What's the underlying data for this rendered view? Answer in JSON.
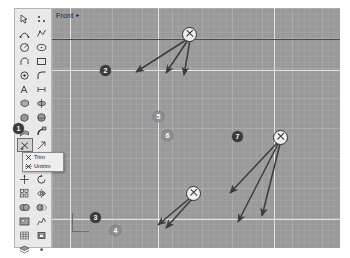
{
  "app": {
    "name": "cad-modeler",
    "viewport_label": "Front",
    "viewport_dropdown_glyph": "▸"
  },
  "viewport": {
    "background_color": "#9a9a9a",
    "grid_color": "#ffffff",
    "axis_color": "#e4e4e4",
    "dark_line_color": "#4a4a4a"
  },
  "markers": [
    {
      "label": "1",
      "style": "dark",
      "x": 18,
      "y": 128,
      "note": "points at selected trim tool in toolbar"
    },
    {
      "label": "2",
      "style": "dark",
      "x": 105,
      "y": 70,
      "note": "on horizontal axis line"
    },
    {
      "label": "3",
      "style": "dark",
      "x": 95,
      "y": 217,
      "note": "near origin gizmo"
    },
    {
      "label": "4",
      "style": "light",
      "x": 115,
      "y": 230,
      "note": "bottom edge"
    },
    {
      "label": "5",
      "style": "light",
      "x": 158,
      "y": 116,
      "note": "on vertical axis"
    },
    {
      "label": "6",
      "style": "light",
      "x": 167,
      "y": 135,
      "note": "below marker 5"
    },
    {
      "label": "7",
      "style": "dark",
      "x": 237,
      "y": 136,
      "note": "left of right X target"
    }
  ],
  "x_targets": [
    {
      "name": "x-target-top",
      "x": 188,
      "y": 33,
      "arrow_count": 3
    },
    {
      "name": "x-target-middle",
      "x": 192,
      "y": 192,
      "arrow_count": 2
    },
    {
      "name": "x-target-right",
      "x": 279,
      "y": 136,
      "arrow_count": 3
    }
  ],
  "toolbar": {
    "name": "modeling-toolbar",
    "selected_tool": "trim-tool",
    "icons": [
      "pointer-select-icon",
      "control-point-icon",
      "arc-icon",
      "polyline-icon",
      "circle-icon",
      "ellipse-icon",
      "curve-icon",
      "rectangle-icon",
      "point-icon",
      "fillet-icon",
      "text-object-icon",
      "dimension-icon",
      "extrude-solid-icon",
      "revolve-solid-icon",
      "box-solid-icon",
      "sphere-solid-icon",
      "surface-loft-icon",
      "surface-sweep-icon",
      "trim-tool-icon",
      "split-icon",
      "transform-move-icon",
      "rotate-icon",
      "array-icon",
      "mirror-icon",
      "boolean-union-icon",
      "boolean-difference-icon",
      "render-icon",
      "analyze-icon",
      "mesh-icon",
      "block-icon",
      "layer-icon",
      "properties-icon"
    ]
  },
  "flyout": {
    "name": "trim-flyout",
    "items": [
      {
        "label": "Trim",
        "icon": "trim-icon"
      },
      {
        "label": "Untrim",
        "icon": "untrim-icon"
      }
    ]
  }
}
